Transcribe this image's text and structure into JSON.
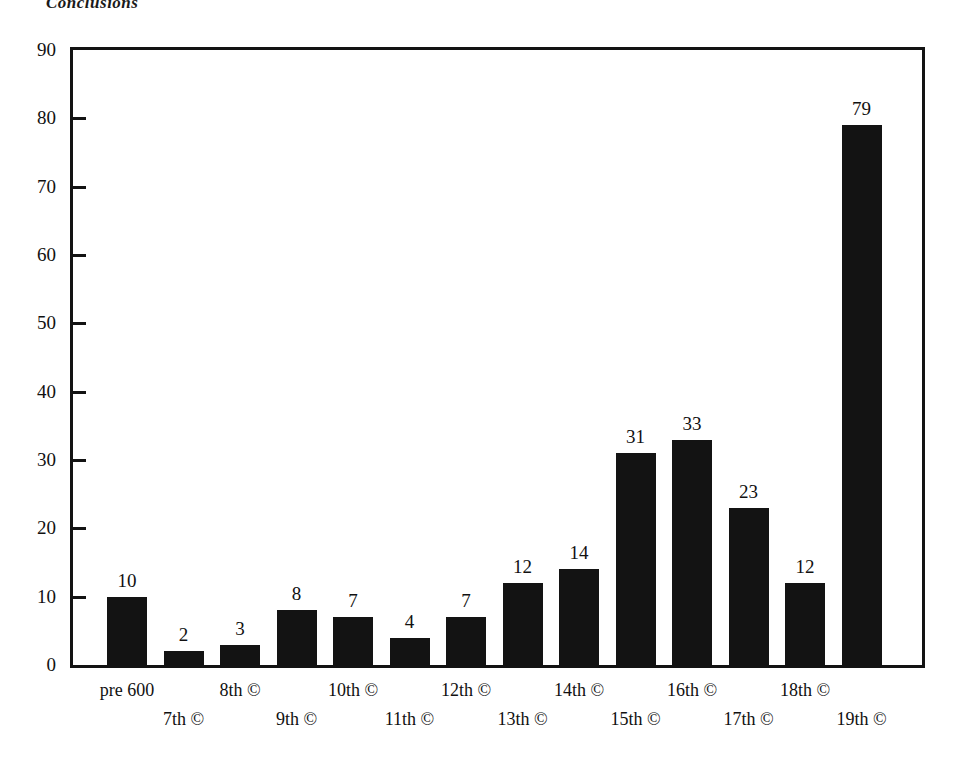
{
  "page": {
    "running_header": "Conclusions"
  },
  "chart_data": {
    "type": "bar",
    "title": "",
    "subtitle": "",
    "xlabel": "",
    "ylabel": "",
    "ylim": [
      0,
      90
    ],
    "ytick_step": 10,
    "yticks": [
      0,
      10,
      20,
      30,
      40,
      50,
      60,
      70,
      80,
      90
    ],
    "ytick_labels": [
      "0",
      "10",
      "20",
      "30",
      "40",
      "50",
      "60",
      "70",
      "80",
      "90"
    ],
    "grid": false,
    "legend": null,
    "bar_color": "#131313",
    "axis_color": "#131313",
    "categories": [
      "pre 600",
      "7th ©",
      "8th ©",
      "9th ©",
      "10th ©",
      "11th ©",
      "12th ©",
      "13th ©",
      "14th ©",
      "15th ©",
      "16th ©",
      "17th ©",
      "18th ©",
      "19th ©"
    ],
    "values": [
      10,
      2,
      3,
      8,
      7,
      4,
      7,
      12,
      14,
      31,
      33,
      23,
      12,
      79
    ],
    "value_labels": [
      "10",
      "2",
      "3",
      "8",
      "7",
      "4",
      "7",
      "12",
      "14",
      "31",
      "33",
      "23",
      "12",
      "79"
    ],
    "xtick_label_rows": [
      0,
      1,
      0,
      1,
      0,
      1,
      0,
      1,
      0,
      1,
      0,
      1,
      0,
      1
    ]
  }
}
